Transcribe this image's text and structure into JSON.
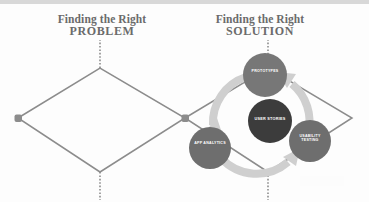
{
  "diagram": {
    "type": "double-diamond-with-cycle",
    "left_title": {
      "line1": "Finding the Right",
      "line2": "PROBLEM"
    },
    "right_title": {
      "line1": "Finding the Right",
      "line2": "SOLUTION"
    },
    "cycle_direction": "counter-clockwise",
    "center_node": {
      "label": "USER STORIES",
      "fill": "#3c3c3c"
    },
    "orbit_nodes": [
      {
        "id": "prototypes",
        "label": "PROTOTYPES",
        "fill": "#777777",
        "position": "top"
      },
      {
        "id": "usability-testing",
        "label": "USABILITY\nTESTING",
        "fill": "#6e6e6e",
        "position": "bottom-right"
      },
      {
        "id": "app-analytics",
        "label": "APP ANALYTICS",
        "fill": "#6e6e6e",
        "position": "bottom-left"
      }
    ],
    "colors": {
      "title_text": "#6b6b6b",
      "diamond_stroke": "#8c8c8c",
      "node_marker": "#8c8c8c",
      "arrow_ring": "#cfcfcf",
      "background": "#fdfdfd",
      "top_strip": "#d8d8d8"
    }
  }
}
